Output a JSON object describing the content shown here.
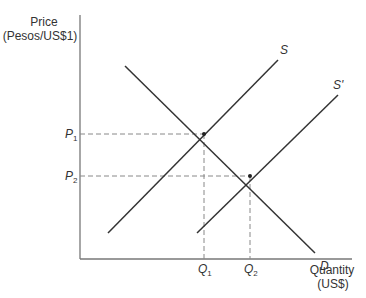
{
  "diagram": {
    "type": "supply-demand",
    "y_axis": {
      "label_line1": "Price",
      "label_line2": "(Pesos/US$1)"
    },
    "x_axis": {
      "label_line1": "Quantity",
      "label_line2": "(US$)"
    },
    "curves": [
      {
        "id": "S",
        "label": "S",
        "kind": "supply"
      },
      {
        "id": "S_prime",
        "label": "S'",
        "kind": "supply"
      },
      {
        "id": "D",
        "label": "D",
        "kind": "demand"
      }
    ],
    "price_levels": [
      {
        "label": "P",
        "sub": "1"
      },
      {
        "label": "P",
        "sub": "2"
      }
    ],
    "quantity_levels": [
      {
        "label": "Q",
        "sub": "1"
      },
      {
        "label": "Q",
        "sub": "2"
      }
    ],
    "colors": {
      "line": "#333333",
      "dashed": "#888888",
      "axis": "#777777"
    }
  }
}
